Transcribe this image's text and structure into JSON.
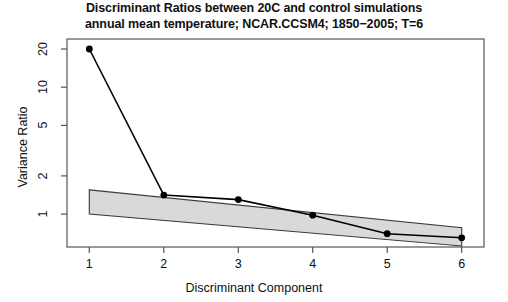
{
  "chart_data": {
    "type": "line",
    "title_lines": [
      "Discriminant Ratios between 20C and control simulations",
      "annual mean temperature; NCAR.CCSM4; 1850−2005; T=6"
    ],
    "xlabel": "Discriminant Component",
    "ylabel": "Variance Ratio",
    "yscale": "log",
    "ylim": [
      0.55,
      24
    ],
    "xlim": [
      0.7,
      6.3
    ],
    "grid": false,
    "legend": null,
    "xticks": [
      1,
      2,
      3,
      4,
      5,
      6
    ],
    "xtick_labels": [
      "1",
      "2",
      "3",
      "4",
      "5",
      "6"
    ],
    "yticks": [
      1,
      2,
      5,
      10,
      20
    ],
    "ytick_labels": [
      "1",
      "2",
      "5",
      "10",
      "20"
    ],
    "x": [
      1,
      2,
      3,
      4,
      5,
      6
    ],
    "values": [
      20.0,
      1.41,
      1.3,
      0.98,
      0.7,
      0.65
    ],
    "series": [
      {
        "name": "variance ratio",
        "x": [
          1,
          2,
          3,
          4,
          5,
          6
        ],
        "values": [
          20.0,
          1.41,
          1.3,
          0.98,
          0.7,
          0.65
        ],
        "marker": "filled-circle",
        "color": "#000000"
      }
    ],
    "band": {
      "name": "confidence band",
      "x": [
        1,
        6
      ],
      "upper": [
        1.55,
        0.78
      ],
      "lower": [
        1.0,
        0.56
      ],
      "fill": "#d9d9d9",
      "stroke": "#3a3a3a"
    },
    "annotations": []
  },
  "figure": {
    "background": "#ffffff",
    "frame_color": "#555555",
    "text_color": "#101010"
  }
}
